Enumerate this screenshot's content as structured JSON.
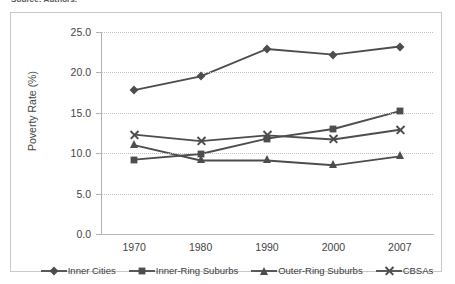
{
  "source_note": "Source: Authors.",
  "chart_data": {
    "type": "line",
    "title": "",
    "xlabel": "",
    "ylabel": "Poverty Rate (%)",
    "categories": [
      "1970",
      "1980",
      "1990",
      "2000",
      "2007"
    ],
    "ylim": [
      0.0,
      25.0
    ],
    "ytick_labels": [
      "0.0",
      "5.0",
      "10.0",
      "15.0",
      "20.0",
      "25.0"
    ],
    "ytick_values": [
      0.0,
      5.0,
      10.0,
      15.0,
      20.0,
      25.0
    ],
    "grid": true,
    "legend_position": "bottom",
    "series": [
      {
        "name": "Inner Cities",
        "marker": "diamond",
        "color": "#4d4d4d",
        "values": [
          17.8,
          19.5,
          22.9,
          22.2,
          23.2
        ]
      },
      {
        "name": "Inner-Ring Suburbs",
        "marker": "square",
        "color": "#4d4d4d",
        "values": [
          9.2,
          9.9,
          11.8,
          13.0,
          15.2
        ]
      },
      {
        "name": "Outer-Ring Suburbs",
        "marker": "triangle",
        "color": "#4d4d4d",
        "values": [
          11.0,
          9.1,
          9.1,
          8.5,
          9.6
        ]
      },
      {
        "name": "CBSAs",
        "marker": "cross",
        "color": "#4d4d4d",
        "values": [
          12.3,
          11.5,
          12.2,
          11.7,
          12.9
        ]
      }
    ]
  }
}
